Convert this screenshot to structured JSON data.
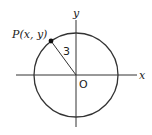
{
  "diagram": {
    "type": "coordinate-circle",
    "axes": {
      "x_label": "x",
      "y_label": "y",
      "origin_label": "O"
    },
    "circle": {
      "center": "O",
      "radius_label": "3"
    },
    "point": {
      "label": "P(x, y)"
    },
    "colors": {
      "stroke": "#333333",
      "background": "#ffffff"
    }
  }
}
